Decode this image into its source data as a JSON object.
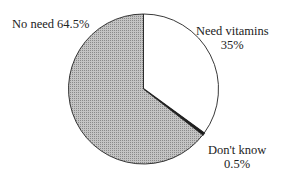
{
  "chart_data": {
    "type": "pie",
    "title": "",
    "slices": [
      {
        "label": "Need vitamins",
        "value": 35,
        "display": "35%",
        "fill": "#ffffff"
      },
      {
        "label": "Don't know",
        "value": 0.5,
        "display": "0.5%",
        "fill": "#111111"
      },
      {
        "label": "No need",
        "value": 64.5,
        "display": "64.5%",
        "fill": "#b8b8b8"
      }
    ],
    "start_angle": "12 o'clock",
    "direction": "clockwise",
    "legend": "none (direct labels)"
  },
  "labels": {
    "no_need": "No need 64.5%",
    "need_vitamins_name": "Need vitamins",
    "need_vitamins_value": "35%",
    "dont_know_name": "Don't know",
    "dont_know_value": "0.5%"
  }
}
